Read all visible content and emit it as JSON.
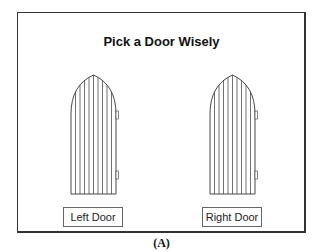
{
  "title": "Pick a Door Wisely",
  "doors": [
    {
      "name": "left",
      "button_label": "Left Door"
    },
    {
      "name": "right",
      "button_label": "Right Door"
    }
  ],
  "caption": "(A)",
  "colors": {
    "line": "#333333",
    "background": "#ffffff"
  }
}
